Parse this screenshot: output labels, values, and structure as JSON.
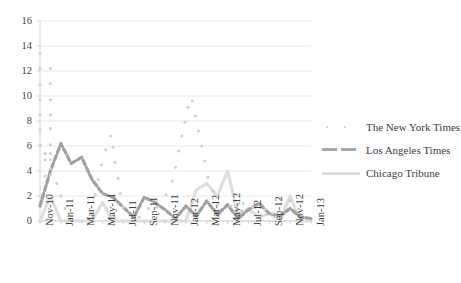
{
  "chart_data": {
    "type": "scatter",
    "title": "",
    "xlabel": "",
    "ylabel": "",
    "ylim": [
      0,
      16
    ],
    "ytick_values": [
      0,
      2,
      4,
      6,
      8,
      10,
      12,
      14,
      16
    ],
    "ytick_labels": [
      "0",
      "2",
      "4",
      "6",
      "8",
      "10",
      "12",
      "14",
      "16"
    ],
    "grid": true,
    "legend_position": "right",
    "x_all": [
      "Nov-10",
      "Dec-10",
      "Jan-11",
      "Feb-11",
      "Mar-11",
      "Apr-11",
      "May-11",
      "Jun-11",
      "Jul-11",
      "Aug-11",
      "Sep-11",
      "Oct-11",
      "Nov-11",
      "Dec-11",
      "Jan-12",
      "Feb-12",
      "Mar-12",
      "Apr-12",
      "May-12",
      "Jun-12",
      "Jul-12",
      "Aug-12",
      "Sep-12",
      "Oct-12",
      "Nov-12",
      "Dec-12",
      "Jan-13"
    ],
    "xtick_labels": [
      "Nov-10",
      "Jan-11",
      "Mar-11",
      "May-11",
      "Jul-11",
      "Sep-11",
      "Nov-11",
      "Jan-12",
      "Mar-12",
      "May-12",
      "Jul-12",
      "Sep-12",
      "Nov-12",
      "Jan-13"
    ],
    "series": [
      {
        "name": "The New York Times",
        "style": "dotted-scatter",
        "color": "#cfcfcf",
        "points": [
          [
            0,
            6.1
          ],
          [
            0,
            7.3
          ],
          [
            0,
            8.5
          ],
          [
            0,
            9.7
          ],
          [
            0,
            10.9
          ],
          [
            0,
            12.2
          ],
          [
            0,
            13.4
          ],
          [
            0.5,
            4.9
          ],
          [
            0.5,
            5.4
          ],
          [
            0.5,
            3.6
          ],
          [
            1,
            6.1
          ],
          [
            1,
            7.4
          ],
          [
            1,
            8.5
          ],
          [
            1,
            9.7
          ],
          [
            1,
            11.0
          ],
          [
            1,
            12.2
          ],
          [
            1,
            4.9
          ],
          [
            1,
            5.4
          ],
          [
            1,
            4.2
          ],
          [
            1,
            3.7
          ],
          [
            1.6,
            3.0
          ],
          [
            2,
            2.0
          ],
          [
            2.4,
            1.0
          ],
          [
            5.3,
            2.1
          ],
          [
            5.6,
            3.3
          ],
          [
            5.9,
            4.5
          ],
          [
            6.3,
            5.7
          ],
          [
            6.8,
            6.8
          ],
          [
            7.0,
            5.9
          ],
          [
            7.2,
            4.7
          ],
          [
            7.5,
            3.4
          ],
          [
            7.7,
            2.2
          ],
          [
            8.0,
            1.1
          ],
          [
            9.5,
            0.3
          ],
          [
            10.4,
            1.0
          ],
          [
            11.2,
            1.1
          ],
          [
            12.1,
            2.1
          ],
          [
            12.7,
            3.2
          ],
          [
            13.0,
            4.3
          ],
          [
            13.3,
            5.6
          ],
          [
            13.6,
            6.8
          ],
          [
            13.9,
            7.9
          ],
          [
            14.2,
            9.1
          ],
          [
            14.6,
            9.6
          ],
          [
            14.9,
            8.4
          ],
          [
            15.2,
            7.2
          ],
          [
            15.5,
            6.0
          ],
          [
            15.8,
            4.8
          ],
          [
            16.1,
            3.5
          ],
          [
            16.6,
            2.4
          ],
          [
            17.0,
            1.3
          ],
          [
            18.3,
            1.2
          ],
          [
            19.1,
            1.4
          ],
          [
            19.5,
            1.4
          ],
          [
            20.4,
            1.1
          ],
          [
            21.6,
            0.9
          ],
          [
            22.3,
            0.6
          ],
          [
            23.0,
            1.8
          ],
          [
            24.0,
            1.6
          ]
        ]
      },
      {
        "name": "Los Angeles Times",
        "style": "dashed-line",
        "color": "#a0a0a0",
        "values": [
          1.2,
          4.0,
          6.2,
          4.6,
          5.1,
          3.3,
          2.2,
          1.9,
          1.1,
          0.3,
          1.9,
          1.5,
          0.9,
          0.2,
          1.2,
          0.4,
          1.6,
          0.5,
          1.3,
          0.2,
          0.9,
          1.4,
          0.6,
          0.4,
          1.0,
          0.3,
          0.2
        ]
      },
      {
        "name": "Chicago Tribune",
        "style": "solid-line",
        "color": "#dedede",
        "values": [
          0.0,
          2.0,
          0.0,
          0.0,
          0.0,
          0.0,
          1.5,
          0.0,
          0.0,
          0.0,
          0.0,
          0.0,
          0.0,
          0.0,
          0.0,
          2.5,
          3.0,
          2.0,
          4.0,
          0.5,
          1.0,
          0.3,
          0.6,
          0.0,
          2.0,
          0.0,
          0.0
        ]
      }
    ]
  },
  "legend": {
    "items": [
      {
        "label": "The New York Times",
        "marker": "dotted-marker",
        "color": "#c9c9c9"
      },
      {
        "label": "Los Angeles Times",
        "marker": "dashed-marker",
        "color": "#a8a8a8"
      },
      {
        "label": "Chicago Tribune",
        "marker": "solid-marker",
        "color": "#dcdcdc"
      }
    ]
  }
}
